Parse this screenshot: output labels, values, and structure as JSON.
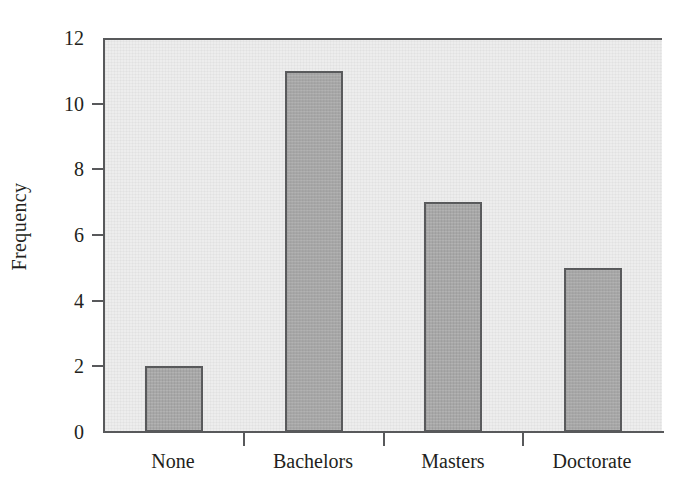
{
  "chart_data": {
    "type": "bar",
    "title": "",
    "subtitle": "",
    "xlabel": "",
    "ylabel": "Frequency",
    "categories": [
      "None",
      "Bachelors",
      "Masters",
      "Doctorate"
    ],
    "values": [
      2,
      11,
      7,
      5
    ],
    "series": [
      {
        "name": "Frequency",
        "values": [
          2,
          11,
          7,
          5
        ]
      }
    ],
    "ylim": [
      0,
      12
    ],
    "y_ticks": [
      0,
      2,
      4,
      6,
      8,
      10,
      12
    ],
    "y_tick_labels": [
      "0",
      "2",
      "4",
      "6",
      "8",
      "10",
      "12"
    ],
    "x_tick_labels": [
      "None",
      "Bachelors",
      "Masters",
      "Doctorate"
    ],
    "grid": false,
    "legend": false,
    "legend_position": "none",
    "annotations": [],
    "colors": {
      "bar_fill": "#a9a9a9",
      "bar_edge": "#58595b",
      "plot_background": "#ededed",
      "figure_background": "#ffffff",
      "axis": "#58595b",
      "text": "#231f20"
    }
  }
}
